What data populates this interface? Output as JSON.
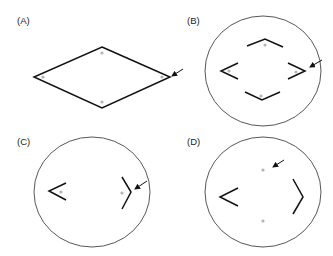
{
  "figure": {
    "panels": [
      {
        "id": "A",
        "label": "(A)",
        "label_pos": [
          17,
          24
        ],
        "outline": null,
        "shapes": [
          {
            "type": "polygon",
            "points": [
              [
                102,
                47
              ],
              [
                170,
                77
              ],
              [
                102,
                108
              ],
              [
                34,
                77
              ]
            ]
          }
        ],
        "dots": [
          [
            102,
            53
          ],
          [
            43,
            77
          ],
          [
            162,
            77
          ],
          [
            102,
            102
          ]
        ],
        "arrow": {
          "from": [
            183,
            69
          ],
          "to": [
            172,
            76
          ]
        }
      },
      {
        "id": "B",
        "label": "(B)",
        "label_pos": [
          187,
          24
        ],
        "outline": {
          "cx": 263,
          "cy": 71,
          "rx": 58,
          "ry": 55
        },
        "shapes": [
          {
            "type": "polyline",
            "points": [
              [
                247,
                46
              ],
              [
                265,
                39
              ],
              [
                283,
                47
              ]
            ]
          },
          {
            "type": "polyline",
            "points": [
              [
                238,
                63
              ],
              [
                221,
                71
              ],
              [
                238,
                79
              ]
            ]
          },
          {
            "type": "polyline",
            "points": [
              [
                288,
                63
              ],
              [
                305,
                71
              ],
              [
                288,
                79
              ]
            ]
          },
          {
            "type": "polyline",
            "points": [
              [
                245,
                92
              ],
              [
                262,
                100
              ],
              [
                280,
                92
              ]
            ]
          }
        ],
        "dots": [
          [
            265,
            45
          ],
          [
            229,
            71
          ],
          [
            296,
            72
          ],
          [
            261,
            96
          ]
        ],
        "arrow": {
          "from": [
            322,
            60
          ],
          "to": [
            310,
            67
          ]
        }
      },
      {
        "id": "C",
        "label": "(C)",
        "label_pos": [
          17,
          145
        ],
        "outline": {
          "cx": 92,
          "cy": 192,
          "rx": 58,
          "ry": 55
        },
        "shapes": [
          {
            "type": "polyline",
            "points": [
              [
                66,
                183
              ],
              [
                49,
                191
              ],
              [
                66,
                200
              ]
            ]
          },
          {
            "type": "polyline",
            "points": [
              [
                122,
                177
              ],
              [
                131,
                192
              ],
              [
                122,
                209
              ]
            ]
          }
        ],
        "dots": [
          [
            61,
            192
          ],
          [
            122,
            193
          ]
        ],
        "arrow": {
          "from": [
            147,
            181
          ],
          "to": [
            135,
            189
          ]
        }
      },
      {
        "id": "D",
        "label": "(D)",
        "label_pos": [
          187,
          145
        ],
        "outline": {
          "cx": 263,
          "cy": 192,
          "rx": 58,
          "ry": 55
        },
        "shapes": [
          {
            "type": "polyline",
            "points": [
              [
                238,
                188
              ],
              [
                220,
                197
              ],
              [
                238,
                206
              ]
            ]
          },
          {
            "type": "polyline",
            "points": [
              [
                293,
                179
              ],
              [
                303,
                197
              ],
              [
                293,
                214
              ]
            ]
          }
        ],
        "dots": [
          [
            263,
            170
          ],
          [
            263,
            221
          ]
        ],
        "arrow": {
          "from": [
            284,
            160
          ],
          "to": [
            273,
            167
          ]
        }
      }
    ],
    "colors": {
      "line": "#111111",
      "circle": "#444444",
      "dot": "#b4b4b4",
      "label": "#222222",
      "background": "#ffffff"
    }
  }
}
